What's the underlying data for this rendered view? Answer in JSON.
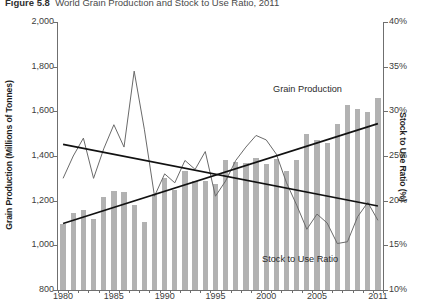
{
  "figure": {
    "number": "Figure 5.8",
    "title": "World Grain Production and Stock to Use Ratio, 2011"
  },
  "axes": {
    "left_title": "Grain Production (Millions of Tonnes)",
    "right_title": "Stock to Use Ratio (%)",
    "left_ticks": [
      "2,000",
      "1,800",
      "1,600",
      "1,400",
      "1,200",
      "1,000",
      "800"
    ],
    "right_ticks": [
      "40%",
      "35%",
      "30%",
      "25%",
      "20%",
      "15%",
      "10%"
    ],
    "x_ticks": [
      "1980",
      "1985",
      "1990",
      "1995",
      "2000",
      "2005",
      "2011"
    ]
  },
  "labels": {
    "grain_production": "Grain Production",
    "stock_to_use_ratio": "Stock to Use Ratio"
  },
  "colors": {
    "bar": "#b2b2b2",
    "line": "#6a6a6a",
    "trend": "#111111",
    "axis": "#6f6f6f",
    "text": "#3a3a3a"
  },
  "chart_data": {
    "type": "bar",
    "title": "World Grain Production and Stock to Use Ratio, 2011",
    "xlabel": "",
    "ylabel": "Grain Production (Millions of Tonnes)",
    "y2label": "Stock to Use Ratio (%)",
    "ylim": [
      800,
      2000
    ],
    "y2lim": [
      10,
      40
    ],
    "ytick_step": 200,
    "y2tick_step": 5,
    "grid": false,
    "legend": "inline-annotation",
    "categories": [
      1980,
      1981,
      1982,
      1983,
      1984,
      1985,
      1986,
      1987,
      1988,
      1989,
      1990,
      1991,
      1992,
      1993,
      1994,
      1995,
      1996,
      1997,
      1998,
      1999,
      2000,
      2001,
      2002,
      2003,
      2004,
      2005,
      2006,
      2007,
      2008,
      2009,
      2010,
      2011
    ],
    "series": [
      {
        "name": "Grain Production",
        "type": "bar",
        "axis": "left",
        "unit": "Millions of Tonnes",
        "values": [
          1094,
          1145,
          1160,
          1120,
          1215,
          1245,
          1240,
          1180,
          1105,
          1230,
          1300,
          1250,
          1335,
          1290,
          1290,
          1275,
          1380,
          1375,
          1370,
          1390,
          1365,
          1385,
          1335,
          1380,
          1500,
          1470,
          1460,
          1545,
          1630,
          1610,
          1595,
          1660
        ]
      },
      {
        "name": "Stock to Use Ratio",
        "type": "line",
        "axis": "right",
        "unit": "%",
        "values": [
          22.5,
          25.0,
          27.0,
          22.5,
          25.8,
          28.5,
          26.0,
          34.5,
          28.0,
          20.5,
          23.0,
          22.0,
          24.5,
          23.5,
          25.5,
          20.5,
          22.2,
          24.5,
          26.0,
          27.3,
          26.8,
          25.2,
          22.0,
          19.5,
          16.8,
          18.5,
          17.5,
          15.2,
          15.4,
          18.2,
          19.8,
          17.8
        ]
      },
      {
        "name": "Grain Production trend",
        "type": "trendline",
        "axis": "left",
        "from": {
          "x": 1980,
          "y": 1098
        },
        "to": {
          "x": 2011,
          "y": 1545
        }
      },
      {
        "name": "Stock to Use Ratio trend",
        "type": "trendline",
        "axis": "right",
        "from": {
          "x": 1980,
          "y": 26.3
        },
        "to": {
          "x": 2011,
          "y": 19.4
        }
      }
    ]
  }
}
